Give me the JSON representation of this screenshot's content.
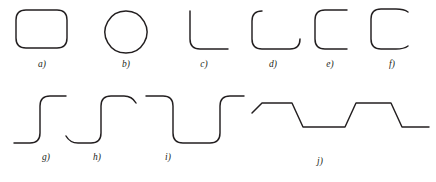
{
  "figure": {
    "stroke_color": "#231f20",
    "background_color": "#ffffff",
    "stroke_width": 1.45,
    "label_font_size": 9.5,
    "rows": [
      {
        "name": "top-row",
        "items": [
          {
            "id": "a",
            "label": "a)",
            "shape_name": "rounded-rectangle",
            "description": "closed rounded rectangle, all four corners filleted",
            "label_x": 42,
            "label_y": 67,
            "path": "M 26 10 L 57 10 Q 67 10 67 20 L 67 38 Q 67 48 57 48 L 26 48 Q 16 48 16 38 L 16 20 Q 16 10 26 10 Z"
          },
          {
            "id": "b",
            "label": "b)",
            "shape_name": "circle",
            "description": "closed circle",
            "label_x": 126,
            "label_y": 67,
            "path": "M 126 11 A 21 21 0 1 1 125.9 11 Z"
          },
          {
            "id": "c",
            "label": "c)",
            "shape_name": "single-rounded-corner-elbow",
            "description": "open L elbow with one filleted corner, vertical then horizontal",
            "label_x": 204,
            "label_y": 67,
            "path": "M 190 11 L 190 39 Q 190 49 200 49 L 228 49"
          },
          {
            "id": "d",
            "label": "d)",
            "shape_name": "u-channel-two-rounded-corners",
            "description": "open U channel, two filleted bottom corners",
            "label_x": 273,
            "label_y": 67,
            "path": "M 262 11 Q 252 11 252 21 L 252 39 Q 252 49 262 49 L 290 49 Q 300 49 300 39"
          },
          {
            "id": "e",
            "label": "e)",
            "shape_name": "c-bracket-two-rounded-corners",
            "description": "open C bracket with filleted top-left and bottom-left corners",
            "label_x": 330,
            "label_y": 67,
            "path": "M 347 10 L 325 10 Q 315 10 315 20 L 315 39 Q 315 49 325 49 L 347 49"
          },
          {
            "id": "f",
            "label": "f)",
            "shape_name": "c-bracket-four-rounded-corners",
            "description": "open C bracket with all four corners filleted, gap on right side",
            "label_x": 392,
            "label_y": 67,
            "path": "M 408 12 Q 404 9 396 9 L 381 9 Q 371 9 371 19 L 371 39 Q 371 49 381 49 L 396 49 Q 404 49 408 46"
          }
        ]
      },
      {
        "name": "bottom-row",
        "items": [
          {
            "id": "g",
            "label": "g)",
            "shape_name": "step-up-rounded",
            "description": "single rising step with filleted inner and outer corner",
            "label_x": 46,
            "label_y": 160,
            "path": "M 14 143 L 30 143 Q 40 143 40 133 L 40 106 Q 40 96 50 96 L 66 96"
          },
          {
            "id": "h",
            "label": "h)",
            "shape_name": "step-up-rounded-with-terminal-fillets",
            "description": "rising step with filleted corners and rounded terminations at both ends",
            "label_x": 97,
            "label_y": 160,
            "path": "M 66 136 Q 70 143 78 143 L 91 143 Q 101 143 101 133 L 101 106 Q 101 96 111 96 L 124 96 Q 132 96 136 103"
          },
          {
            "id": "i",
            "label": "i)",
            "shape_name": "rectangular-pulse-rounded",
            "description": "downward rectangular pulse with four filleted corners",
            "label_x": 168,
            "label_y": 160,
            "path": "M 146 96 L 163 96 Q 173 96 173 106 L 173 133 Q 173 143 183 143 L 210 143 Q 220 143 220 133 L 220 106 Q 220 96 230 96 L 244 96"
          },
          {
            "id": "j",
            "label": "j)",
            "shape_name": "trapezoidal-wave-chamfered",
            "description": "repeating trapezoidal wave with chamfered (sloped) transitions, two troughs",
            "label_x": 320,
            "label_y": 164,
            "path": "M 252 113 L 262 103 L 292 103 L 303 127 L 345 127 L 356 103 L 391 103 L 402 127 L 429 127"
          }
        ]
      }
    ]
  }
}
